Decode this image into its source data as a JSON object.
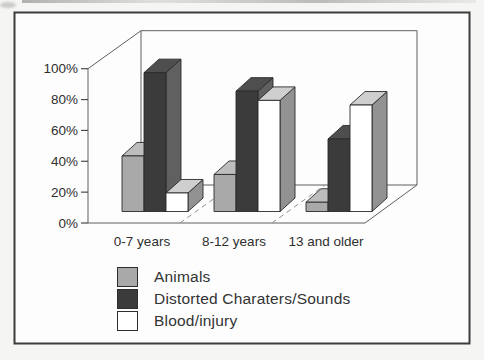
{
  "chart_data": {
    "type": "bar",
    "style": "3d-clustered-column",
    "title": "",
    "xlabel": "",
    "ylabel": "",
    "unit": "%",
    "categories": [
      "0-7 years",
      "8-12 years",
      "13 and older"
    ],
    "series": [
      {
        "name": "Animals",
        "values": [
          36,
          24,
          6
        ],
        "color": "#a9a9a9",
        "color_top": "#bdbdbd",
        "color_side": "#8b8b8b"
      },
      {
        "name": "Distorted Charaters/Sounds",
        "values": [
          90,
          78,
          47
        ],
        "color": "#3b3b3b",
        "color_top": "#4e4e4e",
        "color_side": "#606060"
      },
      {
        "name": "Blood/injury",
        "values": [
          12,
          72,
          69
        ],
        "color": "#ffffff",
        "color_top": "#cfcfcf",
        "color_side": "#929292"
      }
    ],
    "ylim": [
      0,
      100
    ],
    "yticks": [
      "0%",
      "20%",
      "40%",
      "60%",
      "80%",
      "100%"
    ],
    "ytick_values": [
      0,
      20,
      40,
      60,
      80,
      100
    ],
    "grid": false,
    "legend_position": "bottom-left",
    "frame_border_color": "#3c3c3c",
    "axis_line_color": "#5f5f5f",
    "text_color": "#2f2f2f"
  }
}
